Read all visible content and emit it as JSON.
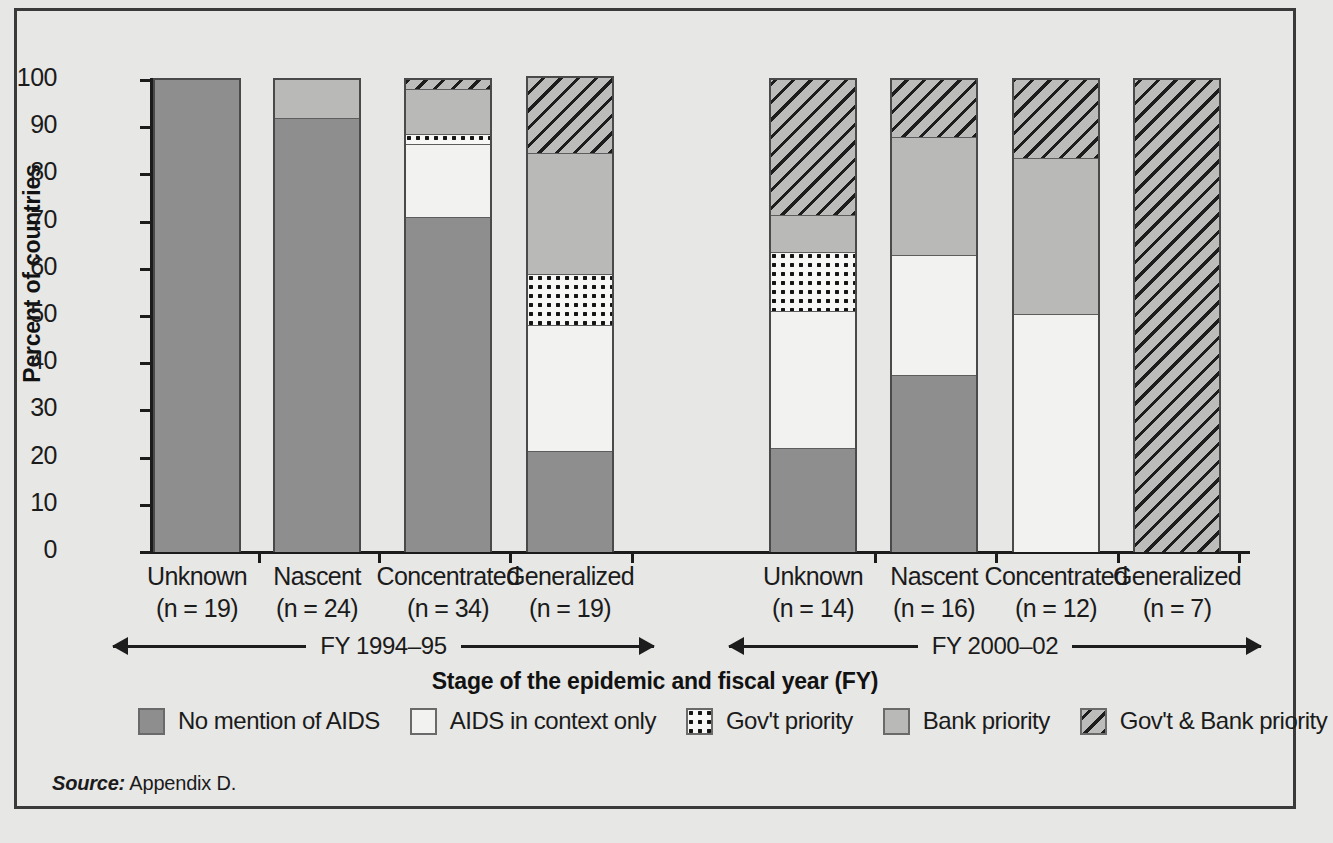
{
  "chart_data": {
    "type": "bar",
    "subtype": "stacked-bar-100-percent",
    "title": "",
    "xlabel": "Stage of the epidemic and fiscal year (FY)",
    "ylabel": "Percent of countries",
    "ylim": [
      0,
      100
    ],
    "ytick_labels": [
      "100",
      "90",
      "80",
      "70",
      "60",
      "50",
      "40",
      "30",
      "20",
      "10",
      "0"
    ],
    "ytick_values": [
      100,
      90,
      80,
      70,
      60,
      50,
      40,
      30,
      20,
      10,
      0
    ],
    "grid": false,
    "legend_position": "bottom",
    "categories": [
      "Unknown",
      "Nascent",
      "Concentrated",
      "Generalized",
      "Unknown",
      "Nascent",
      "Concentrated",
      "Generalized"
    ],
    "category_counts": [
      "(n = 19)",
      "(n = 24)",
      "(n = 34)",
      "(n = 19)",
      "(n = 14)",
      "(n = 16)",
      "(n = 12)",
      "(n = 7)"
    ],
    "groups": [
      {
        "label": "FY 1994–95",
        "span": [
          0,
          3
        ]
      },
      {
        "label": "FY 2000–02",
        "span": [
          4,
          7
        ]
      }
    ],
    "series": [
      {
        "name": "No mention of AIDS",
        "key": "none",
        "values": [
          100,
          92,
          71,
          21.5,
          22,
          37.5,
          0,
          0
        ]
      },
      {
        "name": "AIDS in context only",
        "key": "context",
        "values": [
          0,
          0,
          15.5,
          26.5,
          29,
          25.5,
          50.5,
          0
        ]
      },
      {
        "name": "Gov't priority",
        "key": "gov",
        "values": [
          0,
          0,
          2,
          11,
          12.5,
          0,
          0,
          0
        ]
      },
      {
        "name": "Bank priority",
        "key": "bank",
        "values": [
          0,
          8,
          9.5,
          25.5,
          8,
          25,
          33,
          0
        ]
      },
      {
        "name": "Gov't & Bank priority",
        "key": "both",
        "values": [
          0,
          0,
          2,
          16,
          28.5,
          12,
          16.5,
          100
        ]
      }
    ]
  },
  "legend": {
    "items": [
      {
        "label": "No mention of AIDS",
        "swatch": "solid-dark-gray",
        "color": "#8e8e8e"
      },
      {
        "label": "AIDS in context only",
        "swatch": "solid-white",
        "color": "#f2f2f0"
      },
      {
        "label": "Gov't priority",
        "swatch": "dotted-grid",
        "color": "#f7f7f5"
      },
      {
        "label": "Bank priority",
        "swatch": "solid-light-gray",
        "color": "#b9b9b7"
      },
      {
        "label": "Gov't & Bank priority",
        "swatch": "diagonal-hatch",
        "color": "#bcbcba"
      }
    ]
  },
  "source": {
    "word": "Source:",
    "text": " Appendix D."
  }
}
